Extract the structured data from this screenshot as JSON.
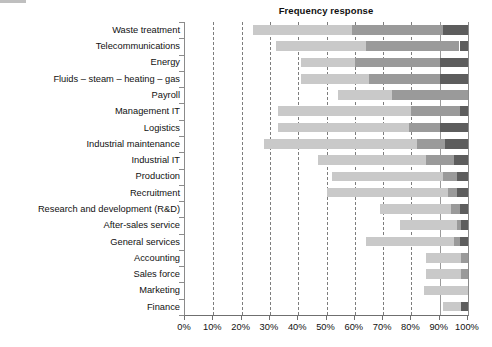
{
  "chart_data": {
    "type": "bar",
    "subtype": "stacked-horizontal",
    "title": "Frequency response",
    "xlabel": "",
    "ylabel": "",
    "xlim": [
      0,
      100
    ],
    "xticks": [
      "0%",
      "10%",
      "20%",
      "30%",
      "40%",
      "50%",
      "60%",
      "70%",
      "80%",
      "90%",
      "100%"
    ],
    "xtick_values": [
      0,
      10,
      20,
      30,
      40,
      50,
      60,
      70,
      80,
      90,
      100
    ],
    "grid": "vertical-dashed",
    "legend": "none",
    "bar_orientation": "horizontal",
    "stack_order": [
      "light",
      "medium",
      "dark"
    ],
    "colors": {
      "light": "#c9c9c9",
      "medium": "#9a9a9a",
      "dark": "#5d5d5d",
      "axis": "#6f6f6f",
      "gridline": "#7d7d7d",
      "text": "#111111"
    },
    "categories": [
      "Waste treatment",
      "Telecommunications",
      "Energy",
      "Fluids – steam – heating – gas",
      "Payroll",
      "Management IT",
      "Logistics",
      "Industrial maintenance",
      "Industrial IT",
      "Production",
      "Recruitment",
      "Research and development (R&D)",
      "After-sales service",
      "General services",
      "Accounting",
      "Sales force",
      "Marketing",
      "Finance"
    ],
    "series": [
      {
        "name": "light",
        "color": "#c9c9c9",
        "starts": [
          24,
          32,
          41,
          41,
          54,
          33,
          33,
          28,
          47,
          52,
          50,
          69,
          76,
          64,
          85,
          85,
          84.5,
          91
        ],
        "ends": [
          59,
          64,
          60,
          65,
          73,
          80,
          79,
          82,
          85,
          91,
          93,
          94,
          96,
          95,
          97.5,
          97.5,
          97.5,
          97.5
        ]
      },
      {
        "name": "medium",
        "color": "#9a9a9a",
        "starts": [
          59,
          64,
          60,
          65,
          73,
          80,
          79,
          82,
          85,
          91,
          93,
          94,
          96,
          95,
          97.5,
          97.5,
          null,
          97.5
        ],
        "ends": [
          91,
          97,
          90,
          90,
          100,
          97,
          90,
          92,
          95,
          96,
          96,
          97,
          97.5,
          97,
          100,
          100,
          null,
          100
        ]
      },
      {
        "name": "dark",
        "color": "#5d5d5d",
        "starts": [
          91,
          97,
          90,
          90,
          null,
          97,
          90,
          92,
          95,
          96,
          96,
          97,
          97.5,
          97,
          null,
          null,
          null,
          null
        ],
        "ends": [
          100,
          100,
          100,
          100,
          null,
          100,
          100,
          100,
          100,
          100,
          100,
          100,
          100,
          100,
          null,
          null,
          null,
          null
        ]
      }
    ],
    "bars": [
      {
        "category": "Waste treatment",
        "segments": [
          {
            "shade": "light",
            "from": 24,
            "to": 59
          },
          {
            "shade": "medium",
            "from": 59,
            "to": 91
          },
          {
            "shade": "dark",
            "from": 91,
            "to": 100
          }
        ]
      },
      {
        "category": "Telecommunications",
        "segments": [
          {
            "shade": "light",
            "from": 32,
            "to": 64
          },
          {
            "shade": "medium",
            "from": 64,
            "to": 97
          },
          {
            "shade": "dark",
            "from": 97,
            "to": 100
          }
        ]
      },
      {
        "category": "Energy",
        "segments": [
          {
            "shade": "light",
            "from": 41,
            "to": 60
          },
          {
            "shade": "medium",
            "from": 60,
            "to": 90
          },
          {
            "shade": "dark",
            "from": 90,
            "to": 100
          }
        ]
      },
      {
        "category": "Fluids – steam – heating – gas",
        "segments": [
          {
            "shade": "light",
            "from": 41,
            "to": 65
          },
          {
            "shade": "medium",
            "from": 65,
            "to": 90
          },
          {
            "shade": "dark",
            "from": 90,
            "to": 100
          }
        ]
      },
      {
        "category": "Payroll",
        "segments": [
          {
            "shade": "light",
            "from": 54,
            "to": 73
          },
          {
            "shade": "medium",
            "from": 73,
            "to": 100
          }
        ]
      },
      {
        "category": "Management IT",
        "segments": [
          {
            "shade": "light",
            "from": 33,
            "to": 80
          },
          {
            "shade": "medium",
            "from": 80,
            "to": 97
          },
          {
            "shade": "dark",
            "from": 97,
            "to": 100
          }
        ]
      },
      {
        "category": "Logistics",
        "segments": [
          {
            "shade": "light",
            "from": 33,
            "to": 79
          },
          {
            "shade": "medium",
            "from": 79,
            "to": 90
          },
          {
            "shade": "dark",
            "from": 90,
            "to": 100
          }
        ]
      },
      {
        "category": "Industrial maintenance",
        "segments": [
          {
            "shade": "light",
            "from": 28,
            "to": 82
          },
          {
            "shade": "medium",
            "from": 82,
            "to": 92
          },
          {
            "shade": "dark",
            "from": 92,
            "to": 100
          }
        ]
      },
      {
        "category": "Industrial IT",
        "segments": [
          {
            "shade": "light",
            "from": 47,
            "to": 85
          },
          {
            "shade": "medium",
            "from": 85,
            "to": 95
          },
          {
            "shade": "dark",
            "from": 95,
            "to": 100
          }
        ]
      },
      {
        "category": "Production",
        "segments": [
          {
            "shade": "light",
            "from": 52,
            "to": 91
          },
          {
            "shade": "medium",
            "from": 91,
            "to": 96
          },
          {
            "shade": "dark",
            "from": 96,
            "to": 100
          }
        ]
      },
      {
        "category": "Recruitment",
        "segments": [
          {
            "shade": "light",
            "from": 50,
            "to": 93
          },
          {
            "shade": "medium",
            "from": 93,
            "to": 96
          },
          {
            "shade": "dark",
            "from": 96,
            "to": 100
          }
        ]
      },
      {
        "category": "Research and development (R&D)",
        "segments": [
          {
            "shade": "light",
            "from": 69,
            "to": 94
          },
          {
            "shade": "medium",
            "from": 94,
            "to": 97
          },
          {
            "shade": "dark",
            "from": 97,
            "to": 100
          }
        ]
      },
      {
        "category": "After-sales service",
        "segments": [
          {
            "shade": "light",
            "from": 76,
            "to": 96
          },
          {
            "shade": "medium",
            "from": 96,
            "to": 97.5
          },
          {
            "shade": "dark",
            "from": 97.5,
            "to": 100
          }
        ]
      },
      {
        "category": "General services",
        "segments": [
          {
            "shade": "light",
            "from": 64,
            "to": 95
          },
          {
            "shade": "medium",
            "from": 95,
            "to": 97
          },
          {
            "shade": "dark",
            "from": 97,
            "to": 100
          }
        ]
      },
      {
        "category": "Accounting",
        "segments": [
          {
            "shade": "light",
            "from": 85,
            "to": 97.5
          },
          {
            "shade": "medium",
            "from": 97.5,
            "to": 100
          }
        ]
      },
      {
        "category": "Sales force",
        "segments": [
          {
            "shade": "light",
            "from": 85,
            "to": 97.5
          },
          {
            "shade": "medium",
            "from": 97.5,
            "to": 100
          }
        ]
      },
      {
        "category": "Marketing",
        "segments": [
          {
            "shade": "light",
            "from": 84.5,
            "to": 100
          }
        ]
      },
      {
        "category": "Finance",
        "segments": [
          {
            "shade": "light",
            "from": 91,
            "to": 97.5
          },
          {
            "shade": "dark",
            "from": 97.5,
            "to": 100
          }
        ]
      }
    ]
  }
}
